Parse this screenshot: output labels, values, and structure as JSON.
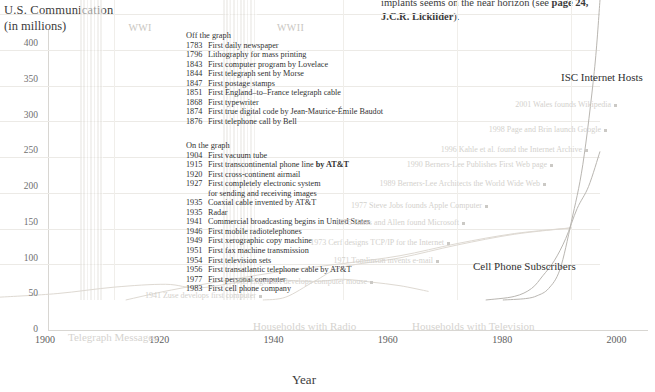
{
  "excerpt": {
    "line1": "implants seems on the near horizon (see ",
    "line1_bold": "page 24,",
    "line2_bold": "J.C.R. Licklider",
    "line2_tail": ")."
  },
  "axes": {
    "y_title_1": "U.S. Communication",
    "y_title_2": "(in millions)",
    "x_title": "Year",
    "y_ticks": [
      "400",
      "350",
      "300",
      "250",
      "200",
      "150",
      "100",
      "50",
      "0"
    ],
    "x_ticks": [
      "1900",
      "1920",
      "1940",
      "1960",
      "1980",
      "2000"
    ]
  },
  "war_bands": [
    {
      "label": "WWI",
      "start": 1914,
      "end": 1918
    },
    {
      "label": "WWII",
      "start": 1939,
      "end": 1945
    }
  ],
  "off_the_graph": {
    "header": "Off the graph",
    "items": [
      {
        "year": "1783",
        "text": "First daily newspaper"
      },
      {
        "year": "1796",
        "text": "Lithography for mass printing"
      },
      {
        "year": "1843",
        "text": "First computer program by Lovelace"
      },
      {
        "year": "1844",
        "text": "First telegraph sent by Morse"
      },
      {
        "year": "1847",
        "text": "First postage stamps"
      },
      {
        "year": "1851",
        "text": "First England–to–France telegraph cable"
      },
      {
        "year": "1868",
        "text": "First typewriter"
      },
      {
        "year": "1874",
        "text": "First true digital code by Jean-Maurice-Émile Baudot"
      },
      {
        "year": "1876",
        "text": "First telephone call by Bell"
      }
    ]
  },
  "on_the_graph": {
    "header": "On the graph",
    "items": [
      {
        "year": "1904",
        "text": "First vacuum tube"
      },
      {
        "year": "1915",
        "text": "First transcontinental phone line by AT&T",
        "bold_tail": "by AT&T"
      },
      {
        "year": "1920",
        "text": "First cross-continent airmail"
      },
      {
        "year": "1927",
        "text": "First completely electronic system"
      },
      {
        "year": "",
        "text": "for sending and receiving images"
      },
      {
        "year": "1935",
        "text": "Coaxial cable invented by AT&T"
      },
      {
        "year": "1935",
        "text": "Radar"
      },
      {
        "year": "1941",
        "text": "Commercial broadcasting begins in United States"
      },
      {
        "year": "1946",
        "text": "First mobile radiotelephones"
      },
      {
        "year": "1949",
        "text": "First xerographic copy machine"
      },
      {
        "year": "1951",
        "text": "First fax machine transmission"
      },
      {
        "year": "1954",
        "text": "First television sets"
      },
      {
        "year": "1956",
        "text": "First transatlantic telephone cable by AT&T"
      },
      {
        "year": "1977",
        "text": "First personal computer"
      },
      {
        "year": "1983",
        "text": "First cell phone company"
      }
    ]
  },
  "annotations": [
    {
      "id": "wikipedia",
      "year": 2001,
      "text": "2001 Wales founds Wikipedia"
    },
    {
      "id": "google",
      "year": 1998,
      "text": "1998 Page and Brin launch Google"
    },
    {
      "id": "internet-archive",
      "year": 1996,
      "text": "1996 Kahle et al. found the Internet Archive"
    },
    {
      "id": "first-web-page",
      "year": 1990,
      "text": "1990 Berners-Lee Publishes First Web page"
    },
    {
      "id": "world-wide-web",
      "year": 1989,
      "text": "1989 Berners-Lee Architects the World Wide Web"
    },
    {
      "id": "apple",
      "year": 1977,
      "text": "1977 Steve Jobs founds Apple Computer"
    },
    {
      "id": "microsoft",
      "year": 1975,
      "text": "1975 Gates and Allen found Microsoft"
    },
    {
      "id": "tcp-ip",
      "year": 1973,
      "text": "1973 Cerf designs TCP/IP for the Internet"
    },
    {
      "id": "email",
      "year": 1971,
      "text": "1971 Tomlinson invents e-mail"
    },
    {
      "id": "mouse",
      "year": 1963,
      "text": "1963 Engelbart develops computer mouse"
    },
    {
      "id": "zuse",
      "year": 1941,
      "text": "1941 Zuse develops first computer"
    }
  ],
  "series_labels": {
    "isc": "ISC Internet Hosts",
    "cell": "Cell Phone Subscribers",
    "radio": "Households with Radio",
    "tv": "Households with Television",
    "telegraph": "Telegraph Messages"
  },
  "chart_data": {
    "type": "line",
    "xlabel": "Year",
    "ylabel": "U.S. Communication (in millions)",
    "xlim": [
      1900,
      2005
    ],
    "ylim": [
      0,
      420
    ],
    "grid": true,
    "legend": "inline-labels",
    "series": [
      {
        "name": "Telegraph Messages",
        "color": "#ded9d2",
        "x": [
          1900,
          1910,
          1920,
          1929,
          1935,
          1945,
          1955,
          1960,
          1965,
          1970,
          1975
        ],
        "values": [
          4,
          9,
          18,
          22,
          17,
          28,
          26,
          29,
          25,
          20,
          12
        ]
      },
      {
        "name": "Households with Radio",
        "color": "#ded9d2",
        "x": [
          1922,
          1930,
          1940,
          1950,
          1960,
          1970,
          1980,
          1990,
          2000
        ],
        "values": [
          0,
          14,
          28,
          41,
          51,
          62,
          79,
          93,
          101
        ]
      },
      {
        "name": "Households with Television",
        "color": "#ded9d2",
        "x": [
          1946,
          1950,
          1955,
          1960,
          1970,
          1980,
          1990,
          2000
        ],
        "values": [
          0,
          4,
          26,
          46,
          59,
          77,
          92,
          101
        ]
      },
      {
        "name": "Cell Phone Subscribers",
        "color": "#b9b6b1",
        "x": [
          1985,
          1990,
          1993,
          1995,
          1997,
          1999,
          2001,
          2003,
          2005
        ],
        "values": [
          0,
          5,
          16,
          34,
          55,
          86,
          128,
          159,
          208
        ]
      },
      {
        "name": "ISC Internet Hosts",
        "color": "#b9b6b1",
        "x": [
          1988,
          1992,
          1994,
          1996,
          1998,
          2000,
          2002,
          2004,
          2005
        ],
        "values": [
          0,
          2,
          6,
          16,
          43,
          110,
          190,
          320,
          420
        ]
      }
    ]
  }
}
